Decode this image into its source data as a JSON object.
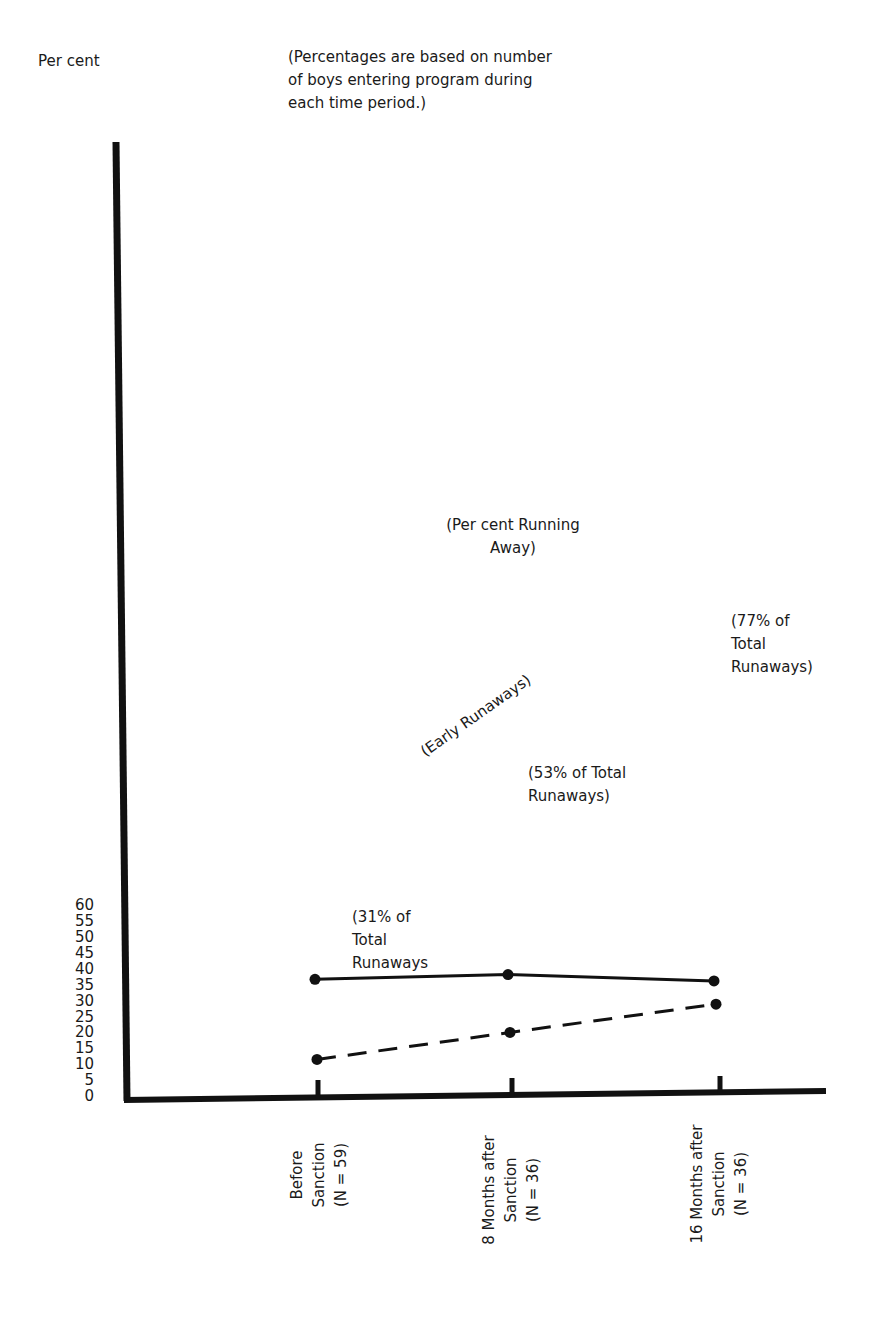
{
  "header": {
    "ylabel": "Per cent",
    "note_lines": [
      "(Percentages are based on number",
      "of boys entering program during",
      "each time period.)"
    ]
  },
  "y_ticks": [
    "60",
    "55",
    "50",
    "45",
    "40",
    "35",
    "30",
    "25",
    "20",
    "15",
    "10",
    "5",
    "0"
  ],
  "x_categories": [
    {
      "lines": [
        "Before",
        "Sanction",
        "(N = 59)"
      ]
    },
    {
      "lines": [
        "8 Months after",
        "Sanction",
        "(N = 36)"
      ]
    },
    {
      "lines": [
        "16 Months after",
        "Sanction",
        "(N = 36)"
      ]
    }
  ],
  "annotations": {
    "running_away": [
      "(Per cent Running",
      "Away)"
    ],
    "early_runaways": "(Early Runaways)",
    "pt1": [
      "(31% of",
      "Total",
      "Runaways"
    ],
    "pt2": [
      "(53% of Total",
      "Runaways)"
    ],
    "pt3": [
      "(77% of",
      "Total",
      "Runaways)"
    ]
  },
  "colors": {
    "ink": "#111111",
    "background": "#ffffff"
  },
  "chart_data": {
    "type": "line",
    "title": "",
    "subtitle": "(Percentages are based on number of boys entering program during each time period.)",
    "xlabel": "",
    "ylabel": "Per cent",
    "ylim": [
      0,
      60
    ],
    "y_tick_step": 5,
    "grid": false,
    "legend": "none (series labeled inline)",
    "categories": [
      "Before Sanction (N = 59)",
      "8 Months after Sanction (N = 36)",
      "16 Months after Sanction (N = 36)"
    ],
    "series": [
      {
        "name": "Per cent Running Away",
        "style": "solid",
        "values": [
          37.0,
          38.5,
          36.5
        ]
      },
      {
        "name": "Early Runaways",
        "style": "dashed",
        "values": [
          11.8,
          20.3,
          29.2
        ],
        "point_labels": [
          "31% of Total Runaways",
          "53% of Total Runaways",
          "77% of Total Runaways"
        ]
      }
    ]
  }
}
